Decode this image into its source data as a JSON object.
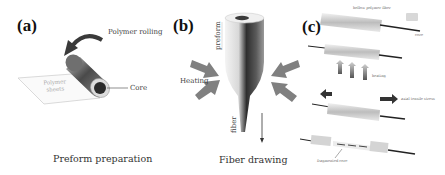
{
  "figure": {
    "panels": [
      {
        "id": "a",
        "label": "(a)",
        "caption": "Preform preparation",
        "annotations": {
          "rolling": "Polymer rolling",
          "core": "Core",
          "sheet": [
            "Polymer",
            "sheets"
          ]
        }
      },
      {
        "id": "b",
        "label": "(b)",
        "caption": "Fiber drawing",
        "annotations": {
          "heating": "Heating",
          "preform": "preform",
          "fiber": "fiber"
        }
      },
      {
        "id": "c",
        "label": "(c)",
        "annotations": {
          "hollow_fiber": "hollow polymer fiber",
          "core": "core",
          "heating": "heating",
          "stress": "axial tensile stress",
          "fragmented": "fragmented core"
        }
      }
    ],
    "colors": {
      "arrow_gray": "#7a7a7a",
      "dark_arrow": "#3a3a3a",
      "core_dark": "#2b2b2b",
      "cladding_light": "#e6e6e6"
    }
  }
}
